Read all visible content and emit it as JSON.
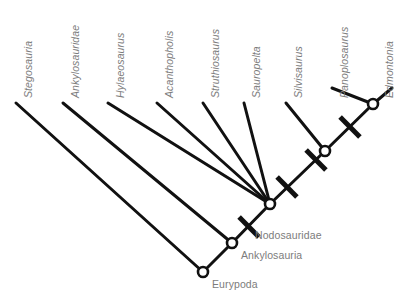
{
  "figure": {
    "kind": "cladogram",
    "background_color": "#ffffff",
    "branch_color": "#111111",
    "node_fill_color": "#ffffff",
    "label_color": "#7c7c7c"
  },
  "taxa": [
    {
      "id": "stegosauria",
      "label": "Stegosauria",
      "label_x": 22,
      "label_y": 98,
      "tip_x": 16,
      "tip_y": 103
    },
    {
      "id": "ankylosauridae",
      "label": "Ankylosauridae",
      "label_x": 69,
      "label_y": 98,
      "tip_x": 63,
      "tip_y": 103
    },
    {
      "id": "hylaeosaurus",
      "label": "Hylaeosaurus",
      "label_x": 114,
      "label_y": 98,
      "tip_x": 108,
      "tip_y": 103
    },
    {
      "id": "acanthopholis",
      "label": "Acanthopholis",
      "label_x": 163,
      "label_y": 98,
      "tip_x": 157,
      "tip_y": 103
    },
    {
      "id": "struthiosaurus",
      "label": "Struthiosaurus",
      "label_x": 209,
      "label_y": 98,
      "tip_x": 203,
      "tip_y": 103
    },
    {
      "id": "sauropelta",
      "label": "Sauropelta",
      "label_x": 250,
      "label_y": 98,
      "tip_x": 244,
      "tip_y": 103
    },
    {
      "id": "silvisaurus",
      "label": "Silvisaurus",
      "label_x": 292,
      "label_y": 98,
      "tip_x": 286,
      "tip_y": 103
    },
    {
      "id": "panoplosaurus",
      "label": "Panoplosaurus",
      "label_x": 338,
      "label_y": 98,
      "tip_x": 332,
      "tip_y": 103
    },
    {
      "id": "edmontonia",
      "label": "Edmontonia",
      "label_x": 383,
      "label_y": 98,
      "tip_x": 392,
      "tip_y": 94
    }
  ],
  "nodes": [
    {
      "id": "eurypoda",
      "label": "Eurypoda",
      "x": 203,
      "y": 272,
      "label_x": 212,
      "label_y": 278,
      "labeled": true
    },
    {
      "id": "ankylosauria",
      "label": "Ankylosauria",
      "x": 232,
      "y": 243,
      "label_x": 241,
      "label_y": 249,
      "labeled": true
    },
    {
      "id": "nodosauridae",
      "label": "Nodosauridae",
      "x": 270,
      "y": 204,
      "label_x": 255,
      "label_y": 229,
      "labeled": true
    },
    {
      "id": "node-silvi",
      "label": "",
      "x": 325,
      "y": 151,
      "label_x": 0,
      "label_y": 0,
      "labeled": false
    },
    {
      "id": "node-panop",
      "label": "",
      "x": 373,
      "y": 104,
      "label_x": 0,
      "label_y": 0,
      "labeled": false
    }
  ],
  "branches": [
    {
      "from": "eurypoda",
      "to_taxon": "stegosauria",
      "x1": 203,
      "y1": 272,
      "x2": 16,
      "y2": 103
    },
    {
      "from": "eurypoda",
      "to_node": "ankylosauria",
      "x1": 203,
      "y1": 272,
      "x2": 232,
      "y2": 243
    },
    {
      "from": "ankylosauria",
      "to_taxon": "ankylosauridae",
      "x1": 232,
      "y1": 243,
      "x2": 63,
      "y2": 103
    },
    {
      "from": "ankylosauria",
      "to_node": "nodosauridae",
      "x1": 232,
      "y1": 243,
      "x2": 270,
      "y2": 204
    },
    {
      "from": "nodosauridae",
      "to_taxon": "hylaeosaurus",
      "x1": 270,
      "y1": 204,
      "x2": 108,
      "y2": 103
    },
    {
      "from": "nodosauridae",
      "to_taxon": "acanthopholis",
      "x1": 270,
      "y1": 204,
      "x2": 157,
      "y2": 103
    },
    {
      "from": "nodosauridae",
      "to_taxon": "struthiosaurus",
      "x1": 270,
      "y1": 204,
      "x2": 203,
      "y2": 103
    },
    {
      "from": "nodosauridae",
      "to_taxon": "sauropelta",
      "x1": 270,
      "y1": 204,
      "x2": 244,
      "y2": 103
    },
    {
      "from": "nodosauridae",
      "to_node": "node-silvi",
      "x1": 270,
      "y1": 204,
      "x2": 325,
      "y2": 151
    },
    {
      "from": "node-silvi",
      "to_taxon": "silvisaurus",
      "x1": 325,
      "y1": 151,
      "x2": 286,
      "y2": 103
    },
    {
      "from": "node-silvi",
      "to_node": "node-panop",
      "x1": 325,
      "y1": 151,
      "x2": 373,
      "y2": 104
    },
    {
      "from": "node-panop",
      "to_taxon": "panoplosaurus",
      "x1": 373,
      "y1": 104,
      "x2": 332,
      "y2": 88
    },
    {
      "from": "node-panop",
      "to_taxon": "edmontonia",
      "x1": 373,
      "y1": 104,
      "x2": 392,
      "y2": 88
    }
  ],
  "character_bars": [
    {
      "id": "bar-ankylosauria",
      "on_branch": "eurypoda-ankylosauria",
      "x": 249,
      "y": 227
    },
    {
      "id": "bar-nodosauridae",
      "on_branch": "ankylosauria-nodosauridae",
      "x": 287,
      "y": 187
    },
    {
      "id": "bar-silvi",
      "on_branch": "nodosauridae-node-silvi",
      "x": 316,
      "y": 160
    },
    {
      "id": "bar-panop",
      "on_branch": "node-silvi-node-panop",
      "x": 350,
      "y": 127
    }
  ],
  "style": {
    "branch_width": 3.0,
    "bar_width": 5.0,
    "bar_half_length": 14,
    "node_radius": 5.0,
    "node_stroke_width": 2.6
  }
}
